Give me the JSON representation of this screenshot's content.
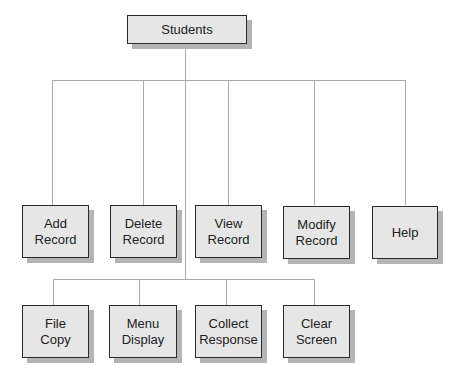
{
  "root": {
    "label": "Students"
  },
  "row1": [
    {
      "label": "Add\nRecord"
    },
    {
      "label": "Delete\nRecord"
    },
    {
      "label": "View\nRecord"
    },
    {
      "label": "Modify\nRecord"
    },
    {
      "label": "Help"
    }
  ],
  "row2": [
    {
      "label": "File\nCopy"
    },
    {
      "label": "Menu\nDisplay"
    },
    {
      "label": "Collect\nResponse"
    },
    {
      "label": "Clear\nScreen"
    }
  ]
}
